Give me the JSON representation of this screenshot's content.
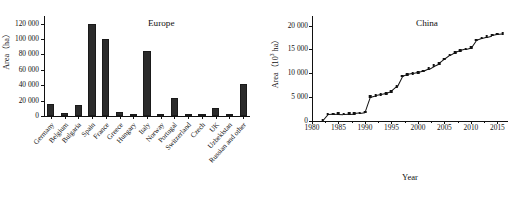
{
  "figure": {
    "panels": [
      "Europe",
      "China"
    ]
  },
  "chart_data": [
    {
      "type": "bar",
      "title": "Europe",
      "xlabel": "",
      "ylabel": "Area（ha）",
      "ylim": [
        0,
        130000
      ],
      "yticks": [
        "0",
        "20 000",
        "40 000",
        "60 000",
        "80 000",
        "100 000",
        "120 000"
      ],
      "ytick_values": [
        0,
        20000,
        40000,
        60000,
        80000,
        100000,
        120000
      ],
      "grid": false,
      "legend": "none",
      "categories": [
        "Germany",
        "Belgium",
        "Bulgaria",
        "Spain",
        "France",
        "Greece",
        "Hungary",
        "Italy",
        "Norway",
        "Portugal",
        "Switzerland",
        "Czech",
        "UK",
        "Uzbekistan",
        "Russian and other"
      ],
      "values": [
        16000,
        4000,
        14000,
        120000,
        100000,
        5500,
        2500,
        85000,
        2800,
        23000,
        2500,
        1800,
        10500,
        600,
        42000
      ]
    },
    {
      "type": "line",
      "title": "China",
      "xlabel": "Year",
      "ylabel": "Area（10³ ha）",
      "xlim": [
        1980,
        2017
      ],
      "ylim": [
        0,
        22000
      ],
      "yticks": [
        "0",
        "5 000",
        "10 000",
        "15 000",
        "20 000"
      ],
      "ytick_values": [
        0,
        5000,
        10000,
        15000,
        20000
      ],
      "xticks": [
        "1980",
        "1985",
        "1990",
        "1995",
        "2000",
        "2005",
        "2010",
        "2015"
      ],
      "xtick_values": [
        1980,
        1985,
        1990,
        1995,
        2000,
        2005,
        2010,
        2015
      ],
      "grid": false,
      "legend": "none",
      "marker": "filled-square",
      "x": [
        1982,
        1983,
        1984,
        1985,
        1986,
        1987,
        1988,
        1989,
        1990,
        1991,
        1992,
        1993,
        1994,
        1995,
        1996,
        1997,
        1998,
        1999,
        2000,
        2001,
        2002,
        2003,
        2004,
        2005,
        2006,
        2007,
        2008,
        2009,
        2010,
        2011,
        2012,
        2013,
        2014,
        2015,
        2016
      ],
      "values": [
        150,
        1450,
        1500,
        1550,
        1500,
        1550,
        1600,
        1700,
        1850,
        5100,
        5400,
        5600,
        5800,
        6200,
        7200,
        9400,
        9800,
        10000,
        10200,
        10500,
        11000,
        11600,
        12100,
        13000,
        13800,
        14400,
        14800,
        15100,
        15400,
        17000,
        17400,
        17700,
        18000,
        18200,
        18300
      ]
    }
  ]
}
